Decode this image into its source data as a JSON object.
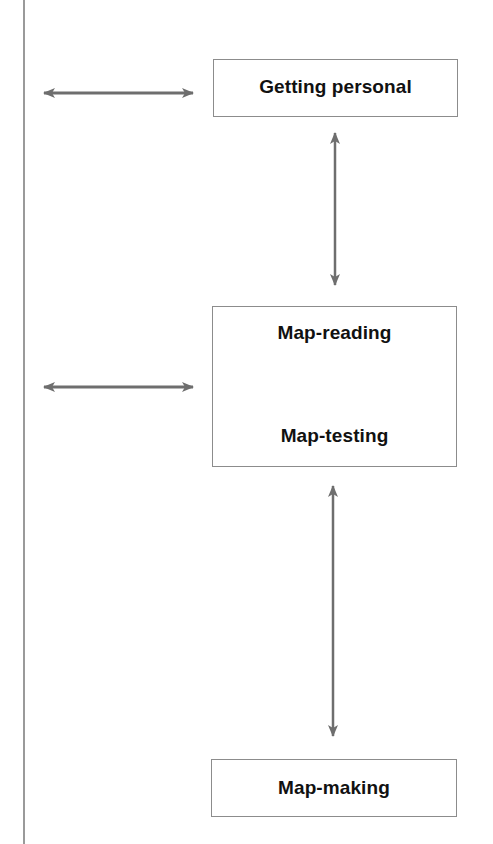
{
  "diagram": {
    "colors": {
      "line": "#9a9a9a",
      "arrow": "#6e6e6e",
      "box_border": "#8c8c8c",
      "text": "#111111"
    },
    "boxes": [
      {
        "id": "getting-personal",
        "lines": [
          "Getting personal"
        ]
      },
      {
        "id": "map-reading-testing",
        "lines": [
          "Map-reading",
          "Map-testing"
        ]
      },
      {
        "id": "map-making",
        "lines": [
          "Map-making"
        ]
      }
    ],
    "arrows": [
      {
        "type": "horizontal-bidirectional",
        "target": "getting-personal"
      },
      {
        "type": "vertical-bidirectional",
        "from": "getting-personal",
        "to": "map-reading-testing"
      },
      {
        "type": "horizontal-bidirectional",
        "target": "map-reading-testing"
      },
      {
        "type": "vertical-bidirectional",
        "from": "map-reading-testing",
        "to": "map-making"
      }
    ]
  }
}
